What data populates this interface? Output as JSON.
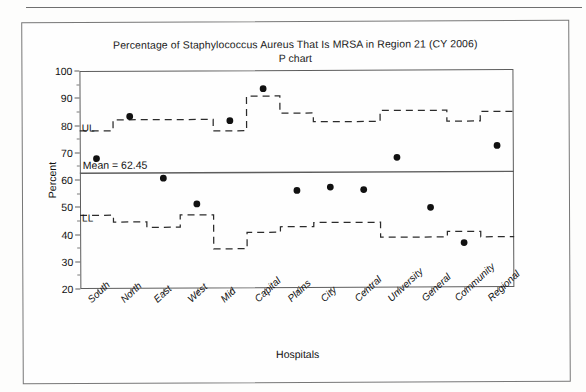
{
  "figure": {
    "title": "Percentage of Staphylococcus Aureus That Is MRSA in Region 21 (CY 2006)",
    "subtitle": "P chart",
    "mean_label": "Mean = 62.45",
    "ul_label": "UL",
    "ll_label": "LL"
  },
  "chart_data": {
    "type": "scatter",
    "title": "Percentage of Staphylococcus Aureus That Is MRSA in Region 21 (CY 2006)",
    "subtitle": "P chart",
    "xlabel": "Hospitals",
    "ylabel": "Percent",
    "ylim": [
      20,
      100
    ],
    "yticks": [
      20,
      30,
      40,
      50,
      60,
      70,
      80,
      90,
      100
    ],
    "grid": false,
    "legend": "none",
    "center_line": 62.45,
    "center_line_label": "Mean = 62.45",
    "categories": [
      "South",
      "North",
      "East",
      "West",
      "Mid",
      "Capital",
      "Plains",
      "City",
      "Central",
      "University",
      "General",
      "Community",
      "Regional"
    ],
    "series": [
      {
        "name": "Percent MRSA",
        "marker": "filled-circle",
        "values": [
          67.8,
          83.2,
          60.5,
          51.0,
          81.5,
          93.2,
          55.8,
          57.0,
          56.0,
          67.8,
          49.4,
          36.4,
          72.0
        ]
      },
      {
        "name": "UL",
        "style": "dashed-step",
        "values": [
          78.0,
          82.0,
          82.0,
          82.0,
          77.8,
          90.5,
          84.2,
          81.0,
          81.0,
          85.0,
          85.0,
          81.0,
          84.5
        ]
      },
      {
        "name": "LL",
        "style": "dashed-step",
        "values": [
          47.0,
          44.5,
          42.5,
          47.0,
          34.5,
          40.5,
          42.5,
          44.0,
          44.0,
          38.5,
          38.5,
          40.5,
          38.5
        ]
      }
    ]
  }
}
